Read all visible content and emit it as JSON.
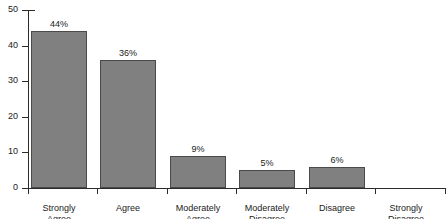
{
  "chart_data": {
    "type": "bar",
    "title": "",
    "xlabel": "",
    "ylabel": "",
    "ylim": [
      0,
      50
    ],
    "ytick_labels": [
      "0",
      "10",
      "20",
      "30",
      "40",
      "50"
    ],
    "yticks": [
      0,
      10,
      20,
      30,
      40,
      50
    ],
    "grid": false,
    "legend": null,
    "categories": [
      "Strongly\nAgree",
      "Agree",
      "Moderately\nAgree",
      "Moderately\nDisagree",
      "Disagree",
      "Strongly\nDisagree"
    ],
    "values": [
      44,
      36,
      9,
      5,
      6,
      0
    ],
    "data_labels": [
      "44%",
      "36%",
      "9%",
      "5%",
      "6%",
      ""
    ],
    "bar_color": "#808080",
    "bar_edge_color": "#4a4a4a",
    "axis_color": "#2b2b2b",
    "background": "#ffffff"
  }
}
